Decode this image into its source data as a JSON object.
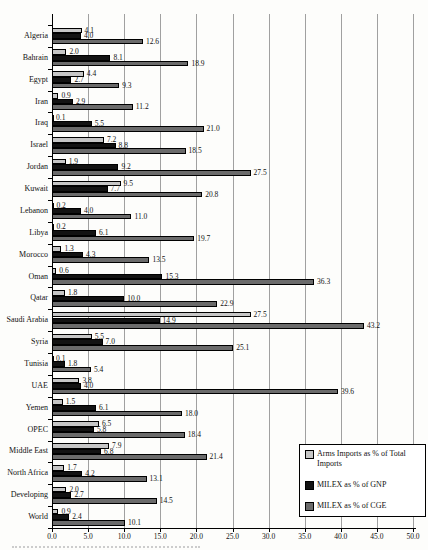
{
  "colors": {
    "background": "#fdfdfb",
    "grid": "#a0a0a0",
    "axis": "#000000",
    "legend_background": "#ffffff"
  },
  "chart_data": {
    "type": "bar",
    "orientation": "horizontal",
    "title": "",
    "xlabel": "",
    "ylabel": "",
    "xlim": [
      0,
      50
    ],
    "x_tick_labels": [
      "0.0",
      "5.0",
      "10.0",
      "15.0",
      "20.0",
      "25.0",
      "30.0",
      "35.0",
      "40.0",
      "45.0",
      "50.0"
    ],
    "grid": true,
    "value_labels": true,
    "legend_position": "bottom-right",
    "categories": [
      "Algeria",
      "Bahrain",
      "Egypt",
      "Iran",
      "Iraq",
      "Israel",
      "Jordan",
      "Kuwait",
      "Lebanon",
      "Libya",
      "Morocco",
      "Oman",
      "Qatar",
      "Saudi Arabia",
      "Syria",
      "Tunisia",
      "UAE",
      "Yemen",
      "OPEC",
      "Middle East",
      "North Africa",
      "Developing",
      "World"
    ],
    "series": [
      {
        "key": "arms_imports",
        "name": "Arms Imports as % of Total Imports",
        "color": "#c6c6c6",
        "values": [
          4.1,
          2.0,
          4.4,
          0.9,
          0.1,
          7.2,
          1.9,
          9.5,
          0.2,
          0.2,
          1.3,
          0.6,
          1.8,
          27.5,
          5.5,
          0.1,
          3.8,
          1.5,
          6.5,
          7.9,
          1.7,
          2.0,
          0.9
        ]
      },
      {
        "key": "milex_gnp",
        "name": "MILEX as % of GNP",
        "color": "#131313",
        "values": [
          4.0,
          8.1,
          2.7,
          2.9,
          5.5,
          8.8,
          9.2,
          7.7,
          4.0,
          6.1,
          4.3,
          15.3,
          10.0,
          14.9,
          7.0,
          1.8,
          4.0,
          6.1,
          5.8,
          6.8,
          4.2,
          2.7,
          2.4
        ]
      },
      {
        "key": "milex_cge",
        "name": "MILEX as % of CGE",
        "color": "#6b6b6b",
        "values": [
          12.6,
          18.9,
          9.3,
          11.2,
          21.0,
          18.5,
          27.5,
          20.8,
          11.0,
          19.7,
          13.5,
          36.3,
          22.9,
          43.2,
          25.1,
          5.4,
          39.6,
          18.0,
          18.4,
          21.4,
          13.1,
          14.5,
          10.1
        ]
      }
    ]
  }
}
